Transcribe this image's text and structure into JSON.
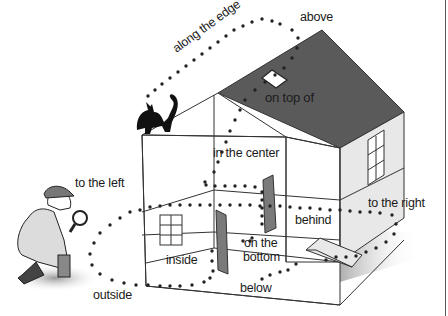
{
  "diagram": {
    "labels": {
      "above": "above",
      "along_the_edge": "along the edge",
      "on_top_of": "on top of",
      "in_the_center": "in the center",
      "to_the_left": "to the left",
      "to_the_right": "to the right",
      "behind": "behind",
      "inside": "inside",
      "on_the_bottom_line1": "on the",
      "on_the_bottom_line2": "bottom",
      "outside": "outside",
      "below": "below"
    },
    "figures": [
      "cat",
      "detective-with-magnifying-glass",
      "house",
      "paper-plane"
    ],
    "colors": {
      "roof": "#5a5a5a",
      "wall_side": "#e6e6e6",
      "door": "#7a7a7a",
      "lines": "#3a3a3a",
      "dots": "#222222"
    }
  }
}
